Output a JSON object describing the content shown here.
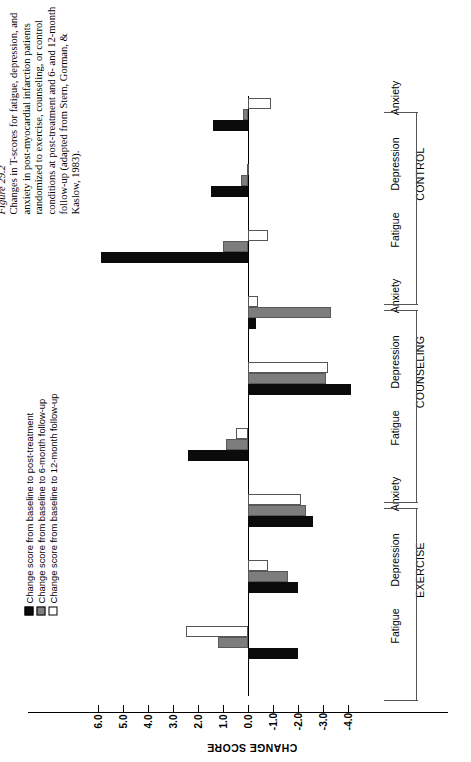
{
  "caption": {
    "figure_number": "Figure 29.2",
    "text": "Changes in T-scores for fatigue, depression, and anxiety in post-myocardial infarction patients randomized to exercise, counseling, or control conditions at post-treatment and 6- and 12-month follow-up (adapted from Stern, Gorman, & Kaslow, 1983)."
  },
  "legend": {
    "items": [
      {
        "label": "Change score from baseline to post-treatment",
        "swatch": "black",
        "color": "#0b0b0b"
      },
      {
        "label": "Change score from baseline to 6-month follow-up",
        "swatch": "gray",
        "color": "#7d7d7d"
      },
      {
        "label": "Change score from baseline to 12-month follow-up",
        "swatch": "white",
        "color": "#ffffff"
      }
    ]
  },
  "chart_data": {
    "type": "bar",
    "orientation": "horizontal",
    "title": "Changes in T-scores for fatigue, depression, and anxiety",
    "xlabel": "",
    "ylabel": "CHANGE SCORE",
    "value_axis_label": "CHANGE SCORE",
    "axis_ticks": [
      "6.0",
      "5.0",
      "4.0",
      "3.0",
      "2.0",
      "1.0",
      "0.0",
      "-1.0",
      "-2.0",
      "-3.0",
      "-4.0"
    ],
    "axis_range": [
      6.0,
      -4.0
    ],
    "grid": false,
    "legend_position": "left",
    "conditions": [
      "EXERCISE",
      "COUNSELING",
      "CONTROL"
    ],
    "measures": [
      "Fatigue",
      "Depression",
      "Anxiety"
    ],
    "series": [
      {
        "name": "Change score from baseline to post-treatment",
        "color": "#0b0b0b"
      },
      {
        "name": "Change score from baseline to 6-month follow-up",
        "color": "#7d7d7d"
      },
      {
        "name": "Change score from baseline to 12-month follow-up",
        "color": "#ffffff"
      }
    ],
    "groups": [
      {
        "condition": "EXERCISE",
        "measure": "Fatigue",
        "post_treatment": -2.0,
        "follow_up_6m": 1.2,
        "follow_up_12m": 2.5
      },
      {
        "condition": "EXERCISE",
        "measure": "Depression",
        "post_treatment": -2.0,
        "follow_up_6m": -1.6,
        "follow_up_12m": -0.8
      },
      {
        "condition": "EXERCISE",
        "measure": "Anxiety",
        "post_treatment": -2.6,
        "follow_up_6m": -2.3,
        "follow_up_12m": -2.1
      },
      {
        "condition": "COUNSELING",
        "measure": "Fatigue",
        "post_treatment": 2.4,
        "follow_up_6m": 0.9,
        "follow_up_12m": 0.5
      },
      {
        "condition": "COUNSELING",
        "measure": "Depression",
        "post_treatment": -4.1,
        "follow_up_6m": -3.1,
        "follow_up_12m": -3.2
      },
      {
        "condition": "COUNSELING",
        "measure": "Anxiety",
        "post_treatment": -0.3,
        "follow_up_6m": -3.3,
        "follow_up_12m": -0.4
      },
      {
        "condition": "CONTROL",
        "measure": "Fatigue",
        "post_treatment": 5.9,
        "follow_up_6m": 1.0,
        "follow_up_12m": -0.8
      },
      {
        "condition": "CONTROL",
        "measure": "Depression",
        "post_treatment": 1.5,
        "follow_up_6m": 0.3,
        "follow_up_12m": 0.05
      },
      {
        "condition": "CONTROL",
        "measure": "Anxiety",
        "post_treatment": 1.4,
        "follow_up_6m": 0.2,
        "follow_up_12m": -0.9
      }
    ]
  }
}
